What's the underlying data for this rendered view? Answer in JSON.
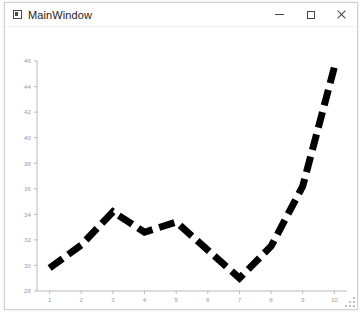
{
  "window": {
    "title": "MainWindow",
    "icon": "app-window-icon",
    "controls": [
      {
        "name": "minimize",
        "glyph": "minimize-icon"
      },
      {
        "name": "maximize",
        "glyph": "maximize-icon"
      },
      {
        "name": "close",
        "glyph": "close-icon"
      }
    ]
  },
  "colors": {
    "line": "#000000",
    "axis": "#b8b8b8",
    "tick_text": "#9b9b9b",
    "plot_background": "#ffffff",
    "window_background": "#ffffff",
    "title_text": "#1a1a1a"
  },
  "chart_data": {
    "type": "line",
    "title": "",
    "xlabel": "",
    "ylabel": "",
    "x": [
      1,
      2,
      3,
      4,
      5,
      6,
      7,
      8,
      9,
      10
    ],
    "values": [
      29.8,
      31.6,
      34.2,
      32.6,
      33.4,
      31.2,
      29.0,
      31.5,
      36.2,
      45.5
    ],
    "series": [
      {
        "name": "series-1",
        "values": [
          29.8,
          31.6,
          34.2,
          32.6,
          33.4,
          31.2,
          29.0,
          31.5,
          36.2,
          45.5
        ],
        "color": "#000000",
        "style": "dashed",
        "width": 7
      }
    ],
    "xlim": [
      0.6,
      10.4
    ],
    "ylim": [
      28,
      46
    ],
    "xticks": [
      1,
      2,
      3,
      4,
      5,
      6,
      7,
      8,
      9,
      10
    ],
    "xticklabels": [
      "1",
      "2",
      "3",
      "4",
      "5",
      "6",
      "7",
      "8",
      "9",
      "10"
    ],
    "yticks": [
      28,
      30,
      32,
      34,
      36,
      38,
      40,
      42,
      44,
      46
    ],
    "yticklabels": [
      "28",
      "30",
      "32",
      "34",
      "36",
      "38",
      "40",
      "42",
      "44",
      "46"
    ],
    "grid": false,
    "legend": null
  }
}
